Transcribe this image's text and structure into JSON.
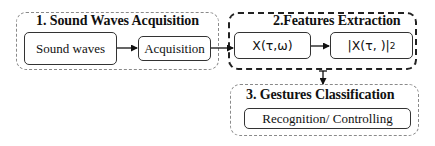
{
  "diagram": {
    "groups": [
      {
        "id": "g1",
        "title": "1. Sound Waves Acquisition",
        "style": "light-dashed",
        "nodes": [
          {
            "id": "n1",
            "label": "Sound waves"
          },
          {
            "id": "n2",
            "label": "Acquisition"
          }
        ]
      },
      {
        "id": "g2",
        "title": "2.Features Extraction",
        "style": "dark-dashed",
        "nodes": [
          {
            "id": "n3",
            "label": "X(τ,ω)"
          },
          {
            "id": "n4",
            "label": "|X(τ,  )|",
            "superscript": "2"
          }
        ]
      },
      {
        "id": "g3",
        "title": "3. Gestures Classification",
        "style": "light-dashed",
        "nodes": [
          {
            "id": "n5",
            "label": "Recognition/ Controlling"
          }
        ]
      }
    ],
    "edges": [
      {
        "from": "n1",
        "to": "n2"
      },
      {
        "from": "n2",
        "to": "n3"
      },
      {
        "from": "n3",
        "to": "n4"
      },
      {
        "from": "g2",
        "to": "g3"
      }
    ],
    "colors": {
      "light_border": "#8a8a8a",
      "dark_border": "#222222",
      "node_border": "#333333",
      "text": "#111111"
    }
  }
}
